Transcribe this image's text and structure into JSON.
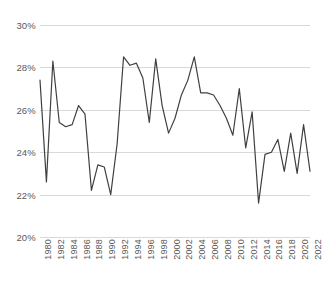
{
  "chart_data": {
    "type": "line",
    "title": "",
    "subtitle": "",
    "xlabel": "",
    "ylabel": "",
    "x": [
      1980,
      1981,
      1982,
      1983,
      1984,
      1985,
      1986,
      1987,
      1988,
      1989,
      1990,
      1991,
      1992,
      1993,
      1994,
      1995,
      1996,
      1997,
      1998,
      1999,
      2000,
      2001,
      2002,
      2003,
      2004,
      2005,
      2006,
      2007,
      2008,
      2009,
      2010,
      2011,
      2012,
      2013,
      2014,
      2015,
      2016,
      2017,
      2018,
      2019,
      2020,
      2021,
      2022
    ],
    "values": [
      27.4,
      22.6,
      28.3,
      25.4,
      25.2,
      25.3,
      26.2,
      25.8,
      22.2,
      23.4,
      23.3,
      22.0,
      24.4,
      28.5,
      28.1,
      28.2,
      27.5,
      25.4,
      28.4,
      26.2,
      24.9,
      25.6,
      26.7,
      27.4,
      28.5,
      26.8,
      26.8,
      26.7,
      26.2,
      25.6,
      24.8,
      27.0,
      24.2,
      25.9,
      21.6,
      23.9,
      24.0,
      24.6,
      23.1,
      24.9,
      23.0,
      25.3,
      23.1
    ],
    "series": [
      {
        "name": "",
        "values": [
          27.4,
          22.6,
          28.3,
          25.4,
          25.2,
          25.3,
          26.2,
          25.8,
          22.2,
          23.4,
          23.3,
          22.0,
          24.4,
          28.5,
          28.1,
          28.2,
          27.5,
          25.4,
          28.4,
          26.2,
          24.9,
          25.6,
          26.7,
          27.4,
          28.5,
          26.8,
          26.8,
          26.7,
          26.2,
          25.6,
          24.8,
          27.0,
          24.2,
          25.9,
          21.6,
          23.9,
          24.0,
          24.6,
          23.1,
          24.9,
          23.0,
          25.3,
          23.1
        ],
        "color": "#404040"
      }
    ],
    "ylim": [
      20,
      30
    ],
    "ytick_values": [
      20,
      22,
      24,
      26,
      28,
      30
    ],
    "ytick_labels": [
      "20%",
      "22%",
      "24%",
      "26%",
      "28%",
      "30%"
    ],
    "xtick_values": [
      1980,
      1982,
      1984,
      1986,
      1988,
      1990,
      1992,
      1994,
      1996,
      1998,
      2000,
      2002,
      2004,
      2006,
      2008,
      2010,
      2012,
      2014,
      2016,
      2018,
      2020,
      2022
    ],
    "xtick_labels": [
      "1980",
      "1982",
      "1984",
      "1986",
      "1988",
      "1990",
      "1992",
      "1994",
      "1996",
      "1998",
      "2000",
      "2002",
      "2004",
      "2006",
      "2008",
      "2010",
      "2012",
      "2014",
      "2016",
      "2018",
      "2020",
      "2022"
    ],
    "grid": true,
    "grid_axis": "y",
    "grid_color": "#d9d9d9",
    "legend": false,
    "legend_position": "none",
    "line_color": "#404040",
    "line_width": 1.2,
    "markers": false,
    "background_color": "#ffffff",
    "tick_label_color": "#595959",
    "xtick_rotation": -90,
    "annotations": []
  }
}
